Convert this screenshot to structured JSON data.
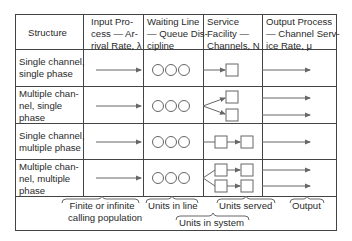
{
  "table": {
    "headers": [
      {
        "lines": [
          "Structure"
        ]
      },
      {
        "lines": [
          "Input Pro-",
          "cess — Ar-",
          "rival Rate, λ"
        ]
      },
      {
        "lines": [
          "Waiting Line",
          "— Queue Dis-",
          "cipline"
        ]
      },
      {
        "lines": [
          "Service",
          "Facility —",
          "Channels, N"
        ]
      },
      {
        "lines": [
          "Output Process",
          "— Channel Serv-",
          "ice Rate, μ"
        ]
      }
    ],
    "rows": [
      {
        "structure": [
          "Single channel,",
          "single phase"
        ],
        "channels": 1,
        "phases": 1
      },
      {
        "structure": [
          "Multiple chan-",
          "nel, single",
          "phase"
        ],
        "channels": 2,
        "phases": 1
      },
      {
        "structure": [
          "Single channel,",
          "multiple phase"
        ],
        "channels": 1,
        "phases": 2
      },
      {
        "structure": [
          "Multiple chan-",
          "nel, multiple",
          "phase"
        ],
        "channels": 2,
        "phases": 2
      }
    ]
  },
  "brackets": {
    "population": [
      "Finite or infinite",
      "calling population"
    ],
    "line": "Units in line",
    "served": "Units served",
    "output": "Output",
    "system": "Units in system"
  },
  "colors": {
    "line": "#444444",
    "shape": "#666666",
    "text": "#2a2a2a"
  }
}
